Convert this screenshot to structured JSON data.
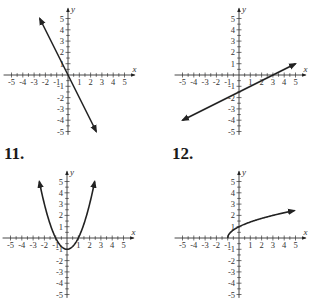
{
  "problems": [
    {
      "number": "",
      "id": "graph-1"
    },
    {
      "number": "",
      "id": "graph-2"
    },
    {
      "number": "11.",
      "id": "graph-3"
    },
    {
      "number": "12.",
      "id": "graph-4"
    }
  ],
  "axes": {
    "x_label": "x",
    "y_label": "y",
    "ticks": [
      "-5",
      "-4",
      "-3",
      "-2",
      "-1",
      "1",
      "2",
      "3",
      "4",
      "5"
    ]
  },
  "chart_data": [
    {
      "type": "line",
      "title": "",
      "xlabel": "x",
      "ylabel": "y",
      "xlim": [
        -5,
        5
      ],
      "ylim": [
        -5,
        5
      ],
      "grid": false,
      "description": "Straight line through origin with slope -2",
      "x": [
        -2.5,
        2.5
      ],
      "y": [
        5,
        -5
      ]
    },
    {
      "type": "line",
      "title": "",
      "xlabel": "x",
      "ylabel": "y",
      "xlim": [
        -5,
        5
      ],
      "ylim": [
        -5,
        5
      ],
      "grid": false,
      "description": "Straight line with slope 1/2, x-intercept 3, y-intercept -1.5",
      "x": [
        -5,
        5
      ],
      "y": [
        -4,
        1
      ]
    },
    {
      "type": "line",
      "title": "11.",
      "xlabel": "x",
      "ylabel": "y",
      "xlim": [
        -5,
        5
      ],
      "ylim": [
        -5,
        5
      ],
      "grid": false,
      "description": "Parabola y = x^2 - 1, vertex (0,-1)",
      "x": [
        -2.45,
        -2,
        -1,
        0,
        1,
        2,
        2.45
      ],
      "y": [
        5,
        3,
        0,
        -1,
        0,
        3,
        5
      ]
    },
    {
      "type": "line",
      "title": "12.",
      "xlabel": "x",
      "ylabel": "y",
      "xlim": [
        -5,
        5
      ],
      "ylim": [
        -5,
        5
      ],
      "grid": false,
      "description": "Square-root curve y = sqrt(x + 1), starting at (-1,0)",
      "x": [
        -1,
        0,
        1,
        2,
        3,
        4,
        5
      ],
      "y": [
        0,
        1,
        1.41,
        1.73,
        2,
        2.24,
        2.45
      ]
    }
  ]
}
